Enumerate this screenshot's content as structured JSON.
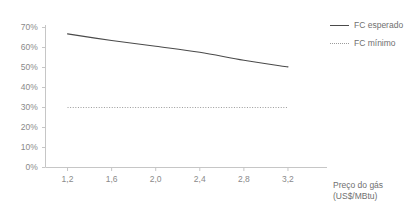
{
  "chart_data": {
    "type": "line",
    "title": "",
    "xlabel": "Preço do gás",
    "xlabel_unit": "(US$/MBtu)",
    "ylabel": "",
    "xlim": [
      1.0,
      3.4
    ],
    "ylim": [
      0,
      70
    ],
    "grid": false,
    "legend_position": "top-right",
    "x_ticks": [
      "1,2",
      "1,6",
      "2,0",
      "2,4",
      "2,8",
      "3,2"
    ],
    "x_tick_values": [
      1.2,
      1.6,
      2.0,
      2.4,
      2.8,
      3.2
    ],
    "y_ticks": [
      "0%",
      "10%",
      "20%",
      "30%",
      "40%",
      "50%",
      "60%",
      "70%"
    ],
    "y_tick_values": [
      0,
      10,
      20,
      30,
      40,
      50,
      60,
      70
    ],
    "x": [
      1.2,
      1.6,
      2.0,
      2.4,
      2.8,
      3.2
    ],
    "series": [
      {
        "name": "FC esperado",
        "style": "solid",
        "color": "#4a4a4a",
        "values": [
          66.8,
          63.5,
          60.6,
          57.6,
          53.6,
          50.3
        ]
      },
      {
        "name": "FC mínimo",
        "style": "dotted",
        "color": "#9b9b9b",
        "values": [
          30,
          30,
          30,
          30,
          30,
          30
        ]
      }
    ]
  },
  "legend": {
    "items": [
      {
        "label": "FC esperado",
        "style": "solid"
      },
      {
        "label": "FC mínimo",
        "style": "dotted"
      }
    ]
  },
  "axis": {
    "x_title": "Preço do gás",
    "x_unit": "(US$/MBtu)"
  },
  "colors": {
    "expected_line": "#4a4a4a",
    "minimum_line": "#9b9b9b",
    "axis": "#c6c6c6",
    "text": "#8a8a8a"
  }
}
